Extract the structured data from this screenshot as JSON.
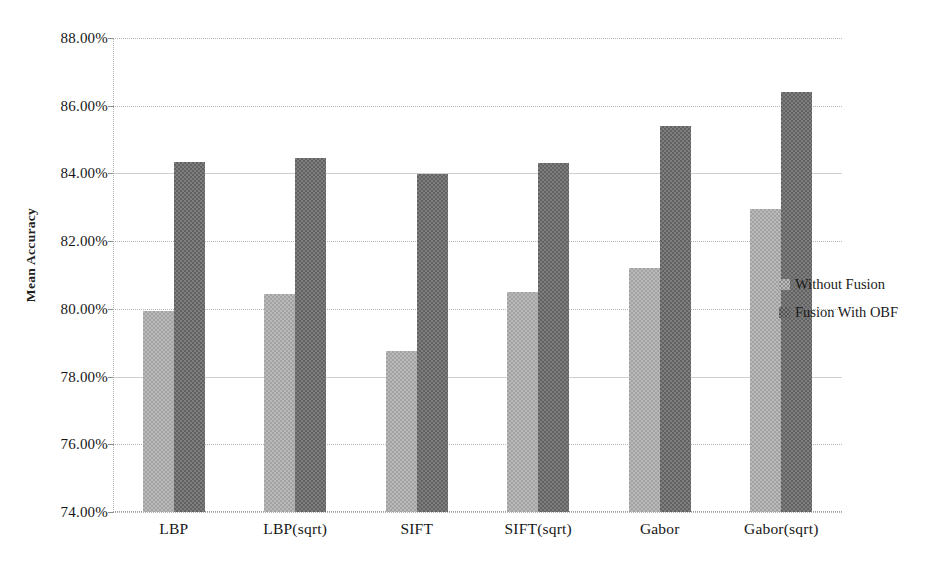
{
  "chart_data": {
    "type": "bar",
    "title": "",
    "xlabel": "",
    "ylabel": "Mean Accuracy",
    "ylim": [
      74.0,
      88.0
    ],
    "ytick_step": 2.0,
    "ytick_labels": [
      "88.00%",
      "86.00%",
      "84.00%",
      "82.00%",
      "80.00%",
      "78.00%",
      "76.00%",
      "74.00%"
    ],
    "ytick_values": [
      88.0,
      86.0,
      84.0,
      82.0,
      80.0,
      78.0,
      76.0,
      74.0
    ],
    "categories": [
      "LBP",
      "LBP(sqrt)",
      "SIFT",
      "SIFT(sqrt)",
      "Gabor",
      "Gabor(sqrt)"
    ],
    "grid": true,
    "legend_position": "right",
    "value_suffix": "%",
    "series": [
      {
        "name": "Without Fusion",
        "color": "#b9b9b9",
        "values": [
          79.95,
          80.45,
          78.75,
          80.5,
          81.2,
          82.95
        ]
      },
      {
        "name": "Fusion With OBF",
        "color": "#7e7e7e",
        "values": [
          84.33,
          84.45,
          83.97,
          84.3,
          85.4,
          86.4
        ]
      }
    ]
  },
  "axis": {
    "y_title": "Mean Accuracy"
  },
  "legend": {
    "items": [
      {
        "label": "Without Fusion"
      },
      {
        "label": "Fusion With OBF"
      }
    ]
  }
}
